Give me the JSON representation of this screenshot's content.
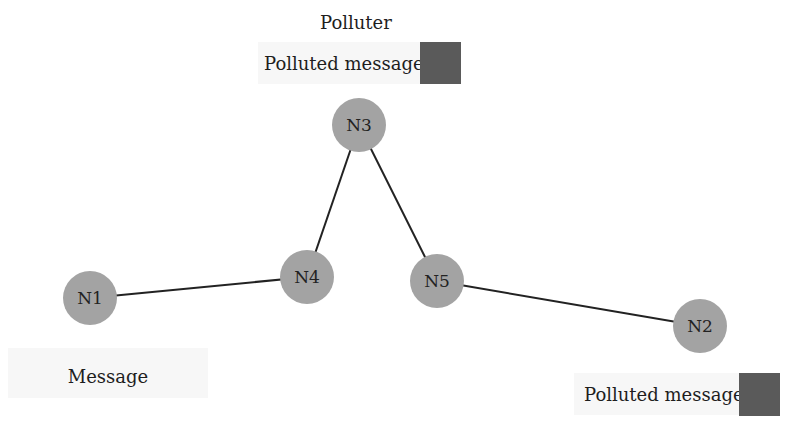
{
  "diagram": {
    "title_label": "Polluter",
    "nodes": [
      {
        "id": "N1",
        "label": "N1",
        "x": 90,
        "y": 298
      },
      {
        "id": "N2",
        "label": "N2",
        "x": 700,
        "y": 326
      },
      {
        "id": "N3",
        "label": "N3",
        "x": 359,
        "y": 125
      },
      {
        "id": "N4",
        "label": "N4",
        "x": 307,
        "y": 277
      },
      {
        "id": "N5",
        "label": "N5",
        "x": 437,
        "y": 281
      }
    ],
    "edges": [
      [
        "N1",
        "N4"
      ],
      [
        "N4",
        "N3"
      ],
      [
        "N3",
        "N5"
      ],
      [
        "N5",
        "N2"
      ]
    ],
    "annotations": {
      "polluter_message": "Polluted message",
      "source_message": "Message",
      "destination_message": "Polluted message"
    },
    "colors": {
      "node": "#a3a3a3",
      "edge": "#222222",
      "polluted_swatch": "#5a5a5a"
    }
  }
}
